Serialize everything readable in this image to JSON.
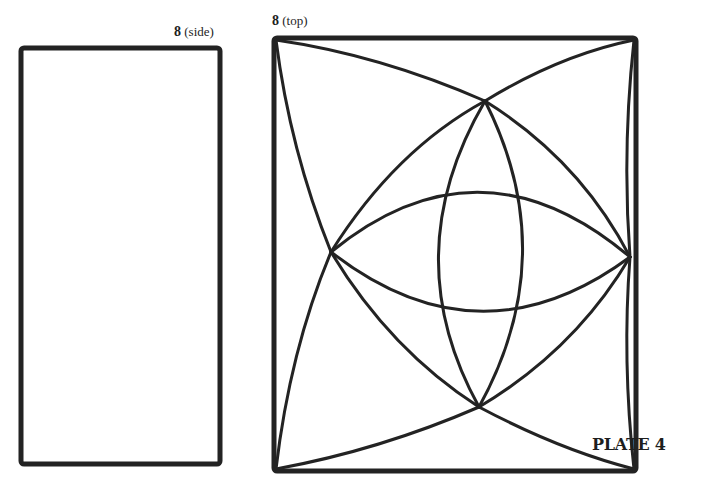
{
  "figures": {
    "side": {
      "number": "8",
      "view": "(side)"
    },
    "top": {
      "number": "8",
      "view": "(top)"
    }
  },
  "plate": {
    "label": "PLATE 4"
  },
  "colors": {
    "ink": "#232323",
    "paper": "#ffffff"
  }
}
